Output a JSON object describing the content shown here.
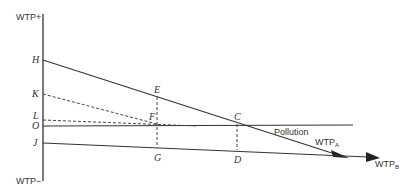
{
  "diagram": {
    "axis": {
      "top_label": "WTP+",
      "bottom_label": "WTP−"
    },
    "points": {
      "H": "H",
      "K": "K",
      "L": "L",
      "O": "O",
      "J": "J",
      "E": "E",
      "F": "F",
      "C": "C",
      "G": "G",
      "D": "D"
    },
    "lines": {
      "pollution": "Pollution",
      "wtp_a_main": "WTP",
      "wtp_a_sub": "A",
      "wtp_b_main": "WTP",
      "wtp_b_sub": "B"
    },
    "colors": {
      "line": "#333333",
      "text": "#333333",
      "background": "#ffffff"
    }
  }
}
